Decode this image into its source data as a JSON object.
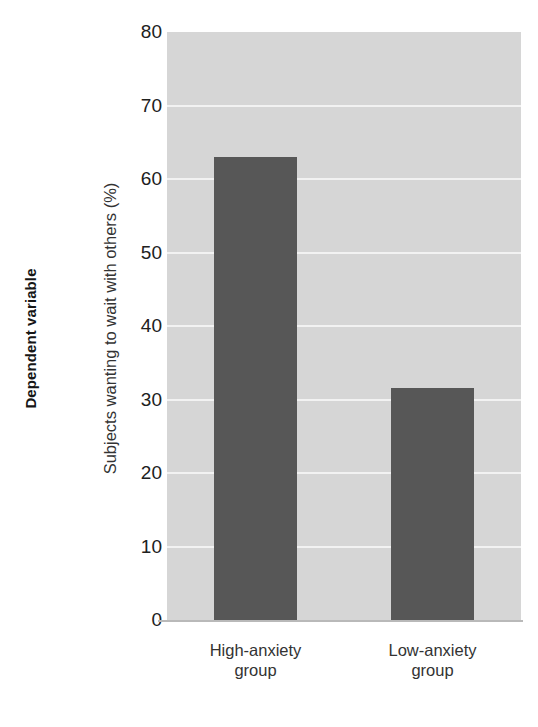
{
  "figure": {
    "dependent_variable_caption": "Dependent variable"
  },
  "chart_data": {
    "type": "bar",
    "title": "",
    "xlabel": "",
    "ylabel": "Subjects wanting to wait with others (%)",
    "categories": [
      "High-anxiety group",
      "Low-anxiety group"
    ],
    "category_lines": [
      [
        "High-anxiety",
        "group"
      ],
      [
        "Low-anxiety",
        "group"
      ]
    ],
    "values": [
      63,
      31.5
    ],
    "ylim": [
      0,
      80
    ],
    "yticks": [
      0,
      10,
      20,
      30,
      40,
      50,
      60,
      70,
      80
    ],
    "ytick_labels": [
      "0",
      "10",
      "20",
      "30",
      "40",
      "50",
      "60",
      "70",
      "80"
    ],
    "grid": true,
    "legend": "none",
    "colors": {
      "bar": "#575757",
      "plot_background": "#d6d6d6",
      "gridline": "#f2f2f2",
      "axis_line": "#b9b9b9",
      "text": "#333333"
    }
  }
}
